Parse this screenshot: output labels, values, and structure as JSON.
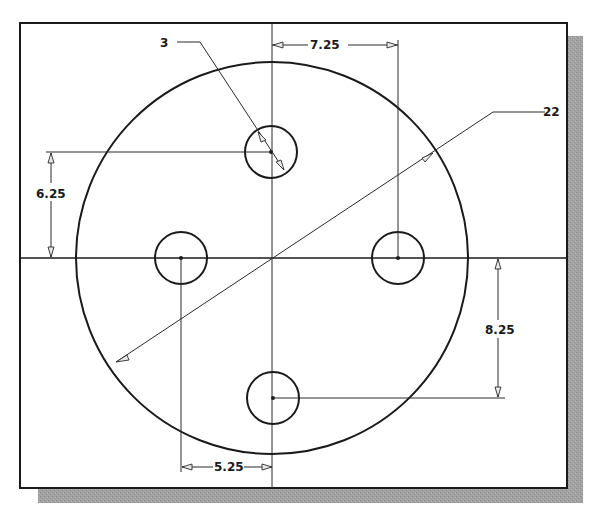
{
  "drawing": {
    "colors": {
      "line": "#1a1a1a",
      "shadow": "#9a9a9a",
      "paper": "#ffffff"
    },
    "frame": {
      "x": 20,
      "y": 23,
      "width": 547,
      "height": 465,
      "shadow_offset": 15
    },
    "plate": {
      "cx": 272,
      "cy": 258,
      "r": 196
    },
    "holes": [
      {
        "name": "top",
        "cx": 271,
        "cy": 152,
        "r": 26
      },
      {
        "name": "left",
        "cx": 181,
        "cy": 258,
        "r": 26
      },
      {
        "name": "right",
        "cx": 398,
        "cy": 258,
        "r": 26
      },
      {
        "name": "bottom",
        "cx": 273,
        "cy": 398,
        "r": 26
      }
    ],
    "dimensions": {
      "hole_diameter": "3",
      "plate_diameter": "22",
      "top_hole_horizontal": "7.25",
      "top_hole_vertical": "6.25",
      "bottom_hole_vertical": "8.25",
      "left_hole_horizontal": "5.25"
    }
  }
}
